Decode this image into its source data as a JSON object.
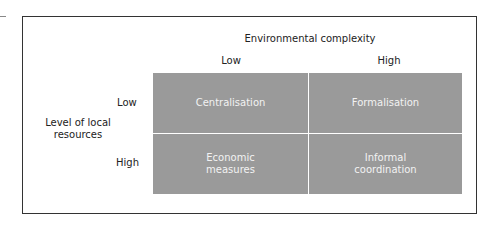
{
  "diagram": {
    "column_axis_title": "Environmental complexity",
    "column_labels": [
      "Low",
      "High"
    ],
    "row_axis_title": "Level of local resources",
    "row_axis_title_lines": [
      "Level of local",
      "resources"
    ],
    "row_labels": [
      "Low",
      "High"
    ],
    "cells": [
      {
        "row": "Low",
        "column": "Low",
        "lines": [
          "Centralisation"
        ]
      },
      {
        "row": "Low",
        "column": "High",
        "lines": [
          "Formalisation"
        ]
      },
      {
        "row": "High",
        "column": "Low",
        "lines": [
          "Economic",
          "measures"
        ]
      },
      {
        "row": "High",
        "column": "High",
        "lines": [
          "Informal",
          "coordination"
        ]
      }
    ],
    "colors": {
      "cell_fill": "#9a9a9a",
      "cell_text": "#f2f2f2",
      "frame": "#333333"
    }
  }
}
